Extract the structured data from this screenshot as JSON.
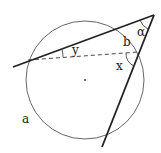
{
  "diagram": {
    "labels": {
      "alpha": "α",
      "b": "b",
      "x": "x",
      "y": "y",
      "a": "a"
    },
    "colors": {
      "stroke": "#222222",
      "circle": "#555555",
      "background": "#ffffff"
    }
  }
}
